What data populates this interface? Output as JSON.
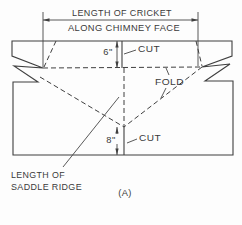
{
  "diagram": {
    "title_line1": "LENGTH OF CRICKET",
    "title_line2": "ALONG CHIMNEY FACE",
    "labels": {
      "cut_top": "CUT",
      "fold": "FOLD",
      "cut_bottom": "CUT",
      "dim_top": "6\"",
      "dim_bottom": "8\"",
      "saddle_line1": "LENGTH OF",
      "saddle_line2": "SADDLE RIDGE",
      "figure": "(A)"
    },
    "colors": {
      "line": "#3f3f3f",
      "text": "#3a3a3a",
      "background": "#fdfdfd"
    }
  }
}
